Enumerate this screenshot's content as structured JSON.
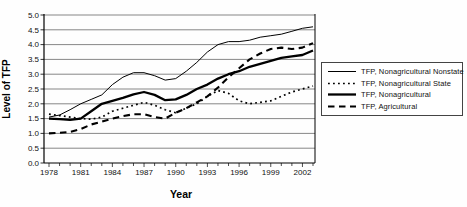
{
  "chart_data": {
    "type": "line",
    "title": "",
    "xlabel": "Year",
    "ylabel": "Level of TFP",
    "xlim": [
      1978,
      2003
    ],
    "ylim": [
      0,
      5
    ],
    "grid": "horizontal",
    "legend_position": "right",
    "line_color": "#000000",
    "x": [
      1978,
      1979,
      1980,
      1981,
      1982,
      1983,
      1984,
      1985,
      1986,
      1987,
      1988,
      1989,
      1990,
      1991,
      1992,
      1993,
      1994,
      1995,
      1996,
      1997,
      1998,
      1999,
      2000,
      2001,
      2002,
      2003
    ],
    "x_tick_labels": [
      "1978",
      "1981",
      "1984",
      "1987",
      "1990",
      "1993",
      "1996",
      "1999",
      "2002"
    ],
    "y_tick_labels": [
      "0.0",
      "0.5",
      "1.0",
      "1.5",
      "2.0",
      "2.5",
      "3.0",
      "3.5",
      "4.0",
      "4.5",
      "5.0"
    ],
    "series": [
      {
        "name": "TFP, Nonagricultural Nonstate",
        "style": "thin-solid",
        "values": [
          1.55,
          1.62,
          1.8,
          2.0,
          2.15,
          2.3,
          2.65,
          2.9,
          3.05,
          3.05,
          2.95,
          2.8,
          2.85,
          3.1,
          3.4,
          3.75,
          4.0,
          4.1,
          4.1,
          4.15,
          4.25,
          4.3,
          4.35,
          4.45,
          4.55,
          4.6
        ]
      },
      {
        "name": "TFP, Nonagricultural State",
        "style": "dotted",
        "values": [
          1.65,
          1.6,
          1.55,
          1.5,
          1.48,
          1.55,
          1.75,
          1.85,
          1.95,
          2.05,
          1.95,
          1.8,
          1.7,
          1.85,
          2.0,
          2.25,
          2.45,
          2.35,
          2.1,
          2.0,
          2.05,
          2.1,
          2.25,
          2.4,
          2.5,
          2.6
        ]
      },
      {
        "name": "TFP, Nonagricultural",
        "style": "thick-solid",
        "values": [
          1.5,
          1.48,
          1.46,
          1.5,
          1.75,
          2.0,
          2.1,
          2.2,
          2.32,
          2.4,
          2.3,
          2.12,
          2.15,
          2.3,
          2.5,
          2.65,
          2.85,
          3.0,
          3.1,
          3.25,
          3.35,
          3.45,
          3.55,
          3.6,
          3.65,
          3.8
        ]
      },
      {
        "name": "TFP, Agricultural",
        "style": "dashed",
        "values": [
          1.0,
          1.02,
          1.05,
          1.15,
          1.3,
          1.4,
          1.5,
          1.58,
          1.65,
          1.65,
          1.55,
          1.5,
          1.7,
          1.85,
          2.05,
          2.25,
          2.55,
          2.9,
          3.2,
          3.5,
          3.7,
          3.85,
          3.9,
          3.85,
          3.9,
          4.05
        ]
      }
    ]
  }
}
